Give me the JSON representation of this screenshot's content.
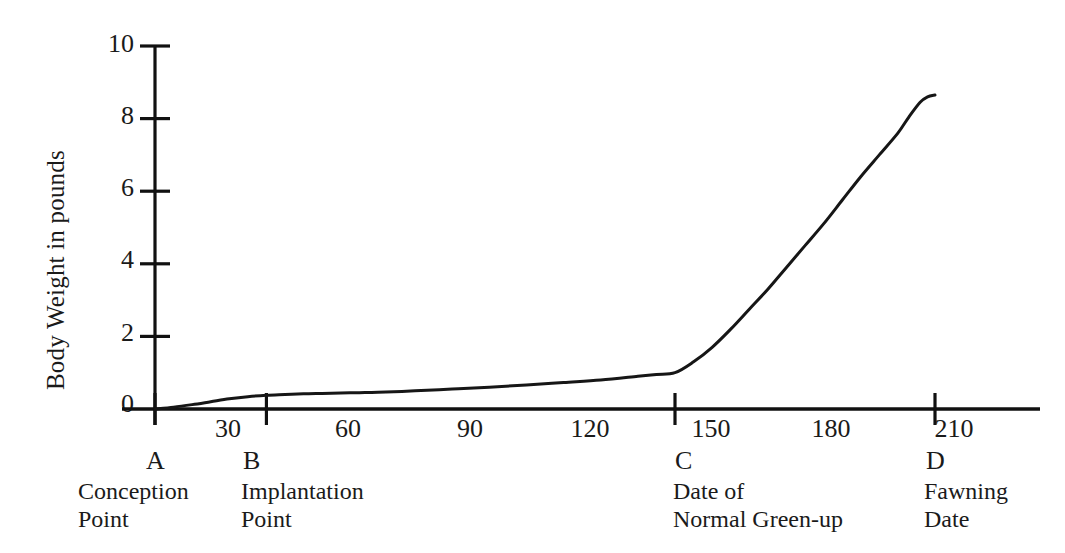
{
  "chart_data": {
    "type": "line",
    "title": "",
    "xlabel": "",
    "ylabel": "Body Weight in pounds",
    "xlim": [
      0,
      225
    ],
    "ylim": [
      0,
      10
    ],
    "grid": false,
    "legend": null,
    "x_ticks": [
      30,
      60,
      90,
      120,
      150,
      180,
      210
    ],
    "y_ticks": [
      0,
      2,
      4,
      6,
      8,
      10
    ],
    "series": [
      {
        "name": "Fetal body weight",
        "x": [
          0,
          5,
          10,
          15,
          20,
          25,
          30,
          35,
          40,
          45,
          50,
          55,
          60,
          70,
          80,
          90,
          100,
          110,
          120,
          130,
          135,
          140,
          145,
          150,
          155,
          160,
          165,
          170,
          175,
          180,
          185,
          190,
          195,
          200,
          203,
          206,
          208,
          210
        ],
        "y": [
          0.0,
          0.05,
          0.12,
          0.2,
          0.28,
          0.34,
          0.38,
          0.4,
          0.42,
          0.43,
          0.44,
          0.45,
          0.46,
          0.5,
          0.55,
          0.6,
          0.66,
          0.73,
          0.8,
          0.9,
          0.95,
          1.0,
          1.3,
          1.7,
          2.2,
          2.75,
          3.3,
          3.9,
          4.5,
          5.1,
          5.75,
          6.4,
          7.0,
          7.6,
          8.05,
          8.45,
          8.6,
          8.65
        ]
      }
    ]
  },
  "axis": {
    "y_title": "Body Weight in pounds",
    "y_tick_labels": [
      "10",
      "8",
      "6",
      "4",
      "2",
      "0"
    ],
    "x_tick_labels": [
      "30",
      "60",
      "90",
      "120",
      "150",
      "180",
      "210"
    ]
  },
  "markers": [
    {
      "letter": "A",
      "caption": "Conception\nPoint",
      "day": 0
    },
    {
      "letter": "B",
      "caption": "Implantation\nPoint",
      "day": 30
    },
    {
      "letter": "C",
      "caption": "Date of\nNormal Green-up",
      "day": 140
    },
    {
      "letter": "D",
      "caption": "Fawning\nDate",
      "day": 210
    }
  ],
  "style": {
    "line_color": "#161616",
    "axis_color": "#111111",
    "background": "#ffffff"
  }
}
